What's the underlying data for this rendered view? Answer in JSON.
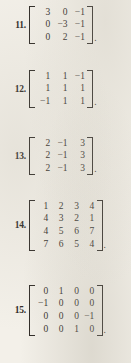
{
  "page": {
    "background_color": "#f3f0e9",
    "text_color": "#2b2723",
    "trailing_punctuation": ".",
    "content_type": "textbook-exercise-matrices"
  },
  "problems": [
    {
      "number": "11.",
      "rows": 3,
      "cols": 3,
      "matrix": [
        [
          "3",
          "0",
          "−1"
        ],
        [
          "0",
          "−3",
          "−1"
        ],
        [
          "0",
          "2",
          "−1"
        ]
      ]
    },
    {
      "number": "12.",
      "rows": 3,
      "cols": 3,
      "matrix": [
        [
          "1",
          "1",
          "−1"
        ],
        [
          "1",
          "1",
          "1"
        ],
        [
          "−1",
          "1",
          "1"
        ]
      ]
    },
    {
      "number": "13.",
      "rows": 3,
      "cols": 3,
      "matrix": [
        [
          "2",
          "−1",
          "3"
        ],
        [
          "2",
          "−1",
          "3"
        ],
        [
          "2",
          "−1",
          "3"
        ]
      ]
    },
    {
      "number": "14.",
      "rows": 4,
      "cols": 4,
      "matrix": [
        [
          "1",
          "2",
          "3",
          "4"
        ],
        [
          "4",
          "3",
          "2",
          "1"
        ],
        [
          "4",
          "5",
          "6",
          "7"
        ],
        [
          "7",
          "6",
          "5",
          "4"
        ]
      ]
    },
    {
      "number": "15.",
      "rows": 4,
      "cols": 4,
      "matrix": [
        [
          "0",
          "1",
          "0",
          "0"
        ],
        [
          "−1",
          "0",
          "0",
          "0"
        ],
        [
          "0",
          "0",
          "0",
          "−1"
        ],
        [
          "0",
          "0",
          "1",
          "0"
        ]
      ]
    }
  ]
}
